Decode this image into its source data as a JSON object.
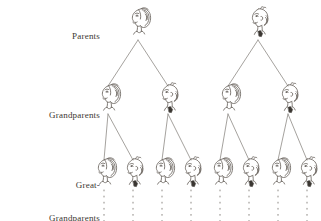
{
  "diagram": {
    "type": "genealogy-tree",
    "background_color": "#ffffff",
    "ink_color": "#6b6660",
    "label_color": "#3a3631",
    "rows": [
      {
        "id": "parents",
        "label": "Parents",
        "label_lines": [
          "Parents"
        ],
        "count": 2,
        "figures": [
          {
            "sex": "female",
            "x": 138,
            "y": 22
          },
          {
            "sex": "male",
            "x": 258,
            "y": 22
          }
        ]
      },
      {
        "id": "grandparents",
        "label": "Grandparents",
        "label_lines": [
          "Grandparents"
        ],
        "count": 4,
        "figures": [
          {
            "sex": "female",
            "x": 108,
            "y": 98
          },
          {
            "sex": "male",
            "x": 168,
            "y": 98
          },
          {
            "sex": "female",
            "x": 228,
            "y": 98
          },
          {
            "sex": "male",
            "x": 288,
            "y": 98
          }
        ]
      },
      {
        "id": "great-grandparents",
        "label": "Great-Grandparents",
        "label_lines": [
          "Great-",
          "Grandparents"
        ],
        "count": 8,
        "figures": [
          {
            "sex": "female",
            "x": 104,
            "y": 172
          },
          {
            "sex": "male",
            "x": 133,
            "y": 172
          },
          {
            "sex": "female",
            "x": 162,
            "y": 172
          },
          {
            "sex": "male",
            "x": 191,
            "y": 172
          },
          {
            "sex": "female",
            "x": 220,
            "y": 172
          },
          {
            "sex": "male",
            "x": 249,
            "y": 172
          },
          {
            "sex": "female",
            "x": 278,
            "y": 172
          },
          {
            "sex": "male",
            "x": 307,
            "y": 172
          }
        ]
      }
    ],
    "connectors": [
      {
        "from": [
          138,
          40
        ],
        "to": [
          108,
          86
        ]
      },
      {
        "from": [
          138,
          40
        ],
        "to": [
          168,
          86
        ]
      },
      {
        "from": [
          258,
          40
        ],
        "to": [
          228,
          86
        ]
      },
      {
        "from": [
          258,
          40
        ],
        "to": [
          288,
          86
        ]
      },
      {
        "from": [
          108,
          114
        ],
        "to": [
          104,
          160
        ]
      },
      {
        "from": [
          108,
          114
        ],
        "to": [
          133,
          160
        ]
      },
      {
        "from": [
          168,
          114
        ],
        "to": [
          162,
          160
        ]
      },
      {
        "from": [
          168,
          114
        ],
        "to": [
          191,
          160
        ]
      },
      {
        "from": [
          228,
          114
        ],
        "to": [
          220,
          160
        ]
      },
      {
        "from": [
          228,
          114
        ],
        "to": [
          249,
          160
        ]
      },
      {
        "from": [
          288,
          114
        ],
        "to": [
          278,
          160
        ]
      },
      {
        "from": [
          288,
          114
        ],
        "to": [
          307,
          160
        ]
      }
    ],
    "continuation_marks": {
      "style": "dotted-vertical",
      "count": 8,
      "x_positions": [
        104,
        133,
        162,
        191,
        220,
        249,
        278,
        307
      ],
      "y_start": 190,
      "y_end": 221
    }
  }
}
